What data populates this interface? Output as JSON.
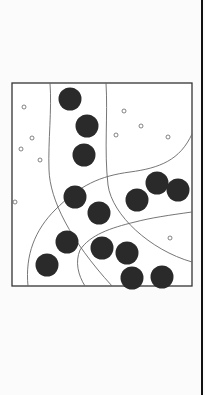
{
  "illustration": {
    "description": "Line drawing of dark spheres distributed in curved stippled channels within a square frame",
    "frame": {
      "x": 12,
      "y": 83,
      "width": 180,
      "height": 203
    },
    "colors": {
      "sphere": "#2a2a2a",
      "line": "#555555",
      "background": "#fbfbfb",
      "edge": "#111111"
    },
    "spheres": [
      {
        "cx": 70,
        "cy": 99
      },
      {
        "cx": 87,
        "cy": 126
      },
      {
        "cx": 84,
        "cy": 155
      },
      {
        "cx": 75,
        "cy": 197
      },
      {
        "cx": 99,
        "cy": 213
      },
      {
        "cx": 137,
        "cy": 200
      },
      {
        "cx": 157,
        "cy": 183
      },
      {
        "cx": 178,
        "cy": 190
      },
      {
        "cx": 67,
        "cy": 242
      },
      {
        "cx": 102,
        "cy": 248
      },
      {
        "cx": 127,
        "cy": 253
      },
      {
        "cx": 47,
        "cy": 265
      },
      {
        "cx": 132,
        "cy": 278
      },
      {
        "cx": 162,
        "cy": 277
      }
    ],
    "bubbles": [
      {
        "cx": 24,
        "cy": 107
      },
      {
        "cx": 124,
        "cy": 111
      },
      {
        "cx": 141,
        "cy": 126
      },
      {
        "cx": 32,
        "cy": 138
      },
      {
        "cx": 21,
        "cy": 149
      },
      {
        "cx": 40,
        "cy": 160
      },
      {
        "cx": 116,
        "cy": 135
      },
      {
        "cx": 168,
        "cy": 137
      },
      {
        "cx": 170,
        "cy": 238
      },
      {
        "cx": 15,
        "cy": 202
      }
    ]
  }
}
